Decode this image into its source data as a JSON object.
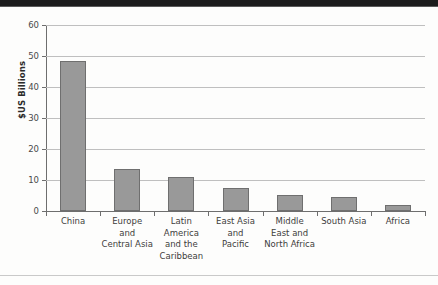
{
  "chart_data": {
    "type": "bar",
    "title": "",
    "subtitle": "",
    "xlabel": "",
    "ylabel": "$US Billions",
    "ylim": [
      0,
      60
    ],
    "yticks": [
      0,
      10,
      20,
      30,
      40,
      50,
      60
    ],
    "ytick_labels": [
      "0",
      "10",
      "20",
      "30",
      "40",
      "50",
      "60"
    ],
    "grid": "horizontal",
    "legend": "none",
    "categories": [
      "China",
      "Europe and Central Asia",
      "Latin America and the Caribbean",
      "East Asia and Pacific",
      "Middle East and North Africa",
      "South Asia",
      "Africa"
    ],
    "category_lines": [
      [
        "China"
      ],
      [
        "Europe",
        "and",
        "Central Asia"
      ],
      [
        "Latin",
        "America",
        "and the",
        "Caribbean"
      ],
      [
        "East Asia",
        "and",
        "Pacific"
      ],
      [
        "Middle",
        "East and",
        "North Africa"
      ],
      [
        "South Asia"
      ],
      [
        "Africa"
      ]
    ],
    "values": [
      48.4,
      13.6,
      11.0,
      7.3,
      5.2,
      4.4,
      2.0
    ],
    "colors": {
      "bar_fill": "#999999",
      "bar_edge": "#6f6f6f",
      "gridline": "#bfbfbf",
      "axis": "#6e6e6e",
      "tick_text": "#4a4a4a",
      "label_text": "#3d3d3d"
    }
  }
}
